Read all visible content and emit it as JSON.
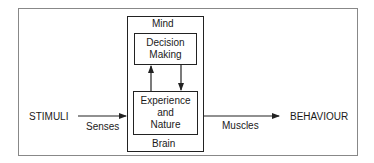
{
  "diagram": {
    "title": "",
    "nodes": {
      "stimuli": "STIMULI",
      "behaviour": "BEHAVIOUR",
      "mind": "Mind",
      "brain": "Brain",
      "decision_making": "Decision\nMaking",
      "experience_nature": "Experience\nand\nNature"
    },
    "edges": {
      "senses": "Senses",
      "muscles": "Muscles"
    },
    "connections": [
      {
        "from": "STIMULI",
        "to": "Mind/Brain",
        "label": "Senses"
      },
      {
        "from": "Experience and Nature",
        "to": "Decision Making",
        "label": ""
      },
      {
        "from": "Decision Making",
        "to": "Experience and Nature",
        "label": ""
      },
      {
        "from": "Mind/Brain",
        "to": "BEHAVIOUR",
        "label": "Muscles"
      }
    ]
  }
}
